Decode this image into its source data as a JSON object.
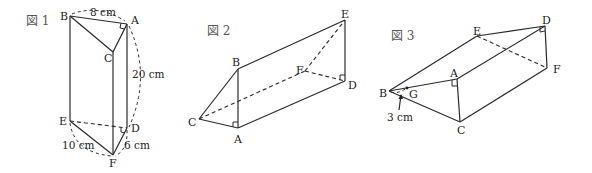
{
  "figures": [
    {
      "title": "図 1",
      "vertices": {
        "A": "A",
        "B": "B",
        "C": "C",
        "D": "D",
        "E": "E",
        "F": "F"
      },
      "lengths": {
        "AB": "8 cm",
        "AD": "20 cm",
        "EF": "10 cm",
        "DF": "6 cm"
      },
      "right_angles": [
        "A",
        "D"
      ]
    },
    {
      "title": "図 2",
      "vertices": {
        "A": "A",
        "B": "B",
        "C": "C",
        "D": "D",
        "E": "E",
        "F": "F"
      },
      "right_angles": [
        "A",
        "D"
      ]
    },
    {
      "title": "図 3",
      "vertices": {
        "A": "A",
        "B": "B",
        "C": "C",
        "D": "D",
        "E": "E",
        "F": "F",
        "G": "G"
      },
      "lengths": {
        "BG": "3 cm"
      },
      "right_angles": [
        "A",
        "D"
      ]
    }
  ]
}
